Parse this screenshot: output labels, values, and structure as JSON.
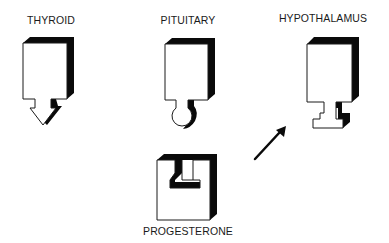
{
  "diagram": {
    "blocks": [
      {
        "id": "thyroid",
        "label": "THYROID",
        "connector": "arrow-tip"
      },
      {
        "id": "pituitary",
        "label": "PITUITARY",
        "connector": "round-knob"
      },
      {
        "id": "hypothalamus",
        "label": "HYPOTHALAMUS",
        "connector": "t-stem"
      },
      {
        "id": "progesterone",
        "label": "PROGESTERONE",
        "connector": "notch-socket"
      }
    ],
    "arrow": {
      "from": "progesterone",
      "to": "hypothalamus"
    },
    "colors": {
      "face": "#ffffff",
      "shadow": "#0a0a0a",
      "outline": "#1a1a1a",
      "text": "#1a1a1a"
    }
  }
}
